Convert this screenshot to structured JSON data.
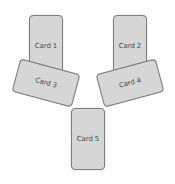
{
  "diagram": {
    "type": "card-layout",
    "background": "#ffffff",
    "card_fill": "#d6d6d6",
    "card_border": "#7c7c7c",
    "cards": [
      {
        "id": "card1",
        "label": "Card 1",
        "orientation": "portrait",
        "rotation_deg": 0
      },
      {
        "id": "card2",
        "label": "Card 2",
        "orientation": "portrait",
        "rotation_deg": 0
      },
      {
        "id": "card3",
        "label": "Card 3",
        "orientation": "landscape",
        "rotation_deg": 15
      },
      {
        "id": "card4",
        "label": "Card 4",
        "orientation": "landscape",
        "rotation_deg": -15
      },
      {
        "id": "card5",
        "label": "Card 5",
        "orientation": "portrait",
        "rotation_deg": 0
      }
    ]
  }
}
